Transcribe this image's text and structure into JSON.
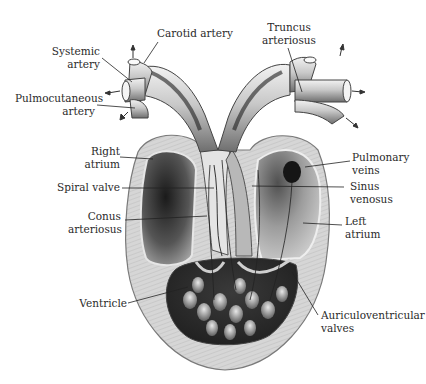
{
  "figure": {
    "style": "grayscale anatomical illustration"
  },
  "labels": {
    "carotid_artery": "Carotid artery",
    "systemic_artery": "Systemic\nartery",
    "pulmocutaneous_artery": "Pulmocutaneous\nartery",
    "truncus_arteriosus": "Truncus\narteriosus",
    "right_atrium": "Right\natrium",
    "spiral_valve": "Spiral valve",
    "conus_arteriosus": "Conus\narteriosus",
    "pulmonary_veins": "Pulmonary\nveins",
    "sinus_venosus": "Sinus\nvenosus",
    "left_atrium": "Left\natrium",
    "ventricle": "Ventricle",
    "auriculoventricular_valves": "Auriculoventricular\nvalves"
  },
  "colors": {
    "background": "#ffffff",
    "tissue_light": "#d9d9d9",
    "tissue_mid": "#9a9a9a",
    "tissue_dark": "#2b2b2b",
    "leader_line": "#222222",
    "text": "#2a2a2a"
  }
}
